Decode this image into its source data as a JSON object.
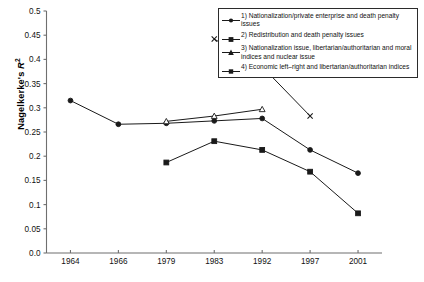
{
  "chart_data": {
    "type": "line",
    "title": "",
    "xlabel": "",
    "ylabel": "Nagelkerke's R2",
    "categories": [
      "1964",
      "1966",
      "1979",
      "1983",
      "1992",
      "1997",
      "2001"
    ],
    "ylim": [
      0,
      0.5
    ],
    "yticks": [
      "0.0",
      "0.05",
      "0.1",
      "0.15",
      "0.2",
      "0.25",
      "0.3",
      "0.35",
      "0.4",
      "0.45",
      "0.5"
    ],
    "ytick_values": [
      0,
      0.05,
      0.1,
      0.15,
      0.2,
      0.25,
      0.3,
      0.35,
      0.4,
      0.45,
      0.5
    ],
    "grid": false,
    "legend_position": "top-right",
    "series": [
      {
        "name": "1) Nationalization/private enterprise and death penalty issues",
        "marker": "circle",
        "x": [
          "1964",
          "1966",
          "1979",
          "1983",
          "1992",
          "1997",
          "2001"
        ],
        "values": [
          0.315,
          0.266,
          0.268,
          0.273,
          0.278,
          0.213,
          0.165
        ]
      },
      {
        "name": "2) Redistribution and death penalty issues",
        "marker": "square",
        "x": [
          "1979",
          "1983",
          "1992",
          "1997",
          "2001"
        ],
        "values": [
          0.187,
          0.231,
          0.213,
          0.168,
          0.082
        ]
      },
      {
        "name": "3) Nationalization issue, libertarian/authoritarian and moral indices and nuclear issue",
        "marker": "triangle",
        "x": [
          "1979",
          "1983",
          "1992"
        ],
        "values": [
          0.272,
          0.283,
          0.297
        ]
      },
      {
        "name": "4) Economic left-right and libertarian/authoritarian indices",
        "marker": "cross",
        "x": [
          "1983",
          "1992",
          "1997"
        ],
        "values": [
          0.442,
          0.385,
          0.283
        ]
      }
    ]
  },
  "legend": {
    "entries": [
      "1) Nationalization/private enterprise and death penalty issues",
      "2) Redistribution and death penalty issues",
      "3) Nationalization issue, libertarian/authoritarian and moral indices and nuclear issue",
      "4) Economic left–right and libertarian/authoritarian indices"
    ]
  },
  "axis": {
    "y_title_main": "Nagelkerke's ",
    "y_title_italic": "R",
    "y_title_sup": "2"
  }
}
